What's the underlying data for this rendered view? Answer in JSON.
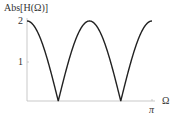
{
  "chart_data": {
    "type": "line",
    "title": "",
    "xlabel": "Ω",
    "ylabel": "Abs[H(Ω)]",
    "x_ticks": [
      {
        "value": 3.14159,
        "label": "π"
      }
    ],
    "y_ticks": [
      {
        "value": 1,
        "label": "1"
      },
      {
        "value": 2,
        "label": "2"
      }
    ],
    "xlim": [
      0,
      3.14159
    ],
    "ylim": [
      0,
      2
    ],
    "grid": false,
    "legend": null,
    "series": [
      {
        "name": "Abs[H(Ω)]",
        "expression": "|2cos(2Ω)|",
        "x": [
          0,
          0.3927,
          0.7854,
          1.1781,
          1.5708,
          1.9635,
          2.3562,
          2.7489,
          3.14159
        ],
        "values": [
          2,
          1.414,
          0,
          1.414,
          2,
          1.414,
          0,
          1.414,
          2
        ]
      }
    ]
  }
}
